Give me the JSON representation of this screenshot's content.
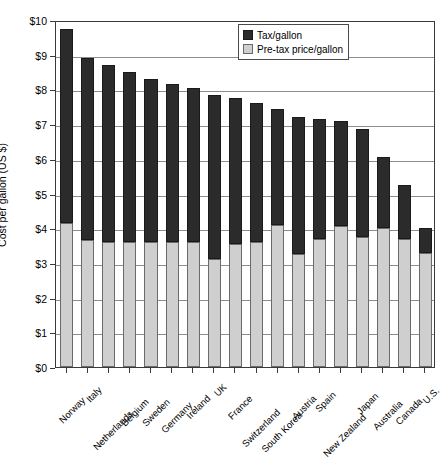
{
  "chart_data": {
    "type": "bar",
    "subtype": "stacked-vertical",
    "title": "",
    "xlabel": "",
    "ylabel": "Cost per gallon (US $)",
    "ylim": [
      0,
      10
    ],
    "ytick_step": 1,
    "ytick_labels": [
      "$0",
      "$1",
      "$2",
      "$3",
      "$4",
      "$5",
      "$6",
      "$7",
      "$8",
      "$9",
      "$10"
    ],
    "ytick_values": [
      0,
      1,
      2,
      3,
      4,
      5,
      6,
      7,
      8,
      9,
      10
    ],
    "grid": "horizontal",
    "legend_position": "top-right",
    "categories": [
      "Norway",
      "Italy",
      "Netherlands",
      "Belgium",
      "Sweden",
      "Germany",
      "Ireland",
      "UK",
      "France",
      "Switzerland",
      "South Korea",
      "Austria",
      "Spain",
      "New Zealand",
      "Japan",
      "Australia",
      "Canada",
      "U.S."
    ],
    "series": [
      {
        "name": "Pre-tax price/gallon",
        "color": "#cfcfcf",
        "values": [
          4.15,
          3.65,
          3.6,
          3.6,
          3.6,
          3.6,
          3.6,
          3.1,
          3.55,
          3.6,
          4.1,
          3.25,
          3.7,
          4.05,
          3.75,
          4.0,
          3.7,
          3.3
        ]
      },
      {
        "name": "Tax/gallon",
        "color": "#2b2b2b",
        "values": [
          5.6,
          5.25,
          5.1,
          4.9,
          4.7,
          4.55,
          4.45,
          4.75,
          4.2,
          4.0,
          3.35,
          3.95,
          3.45,
          3.05,
          3.1,
          2.05,
          1.55,
          0.7
        ]
      }
    ],
    "totals": [
      9.75,
      8.9,
      8.7,
      8.5,
      8.3,
      8.15,
      8.05,
      7.85,
      7.75,
      7.6,
      7.45,
      7.2,
      7.15,
      7.1,
      6.85,
      6.05,
      5.25,
      4.0
    ]
  },
  "legend": {
    "items": [
      {
        "label": "Tax/gallon",
        "swatch": "dark-swatch-icon"
      },
      {
        "label": "Pre-tax price/gallon",
        "swatch": "light-swatch-icon"
      }
    ]
  }
}
